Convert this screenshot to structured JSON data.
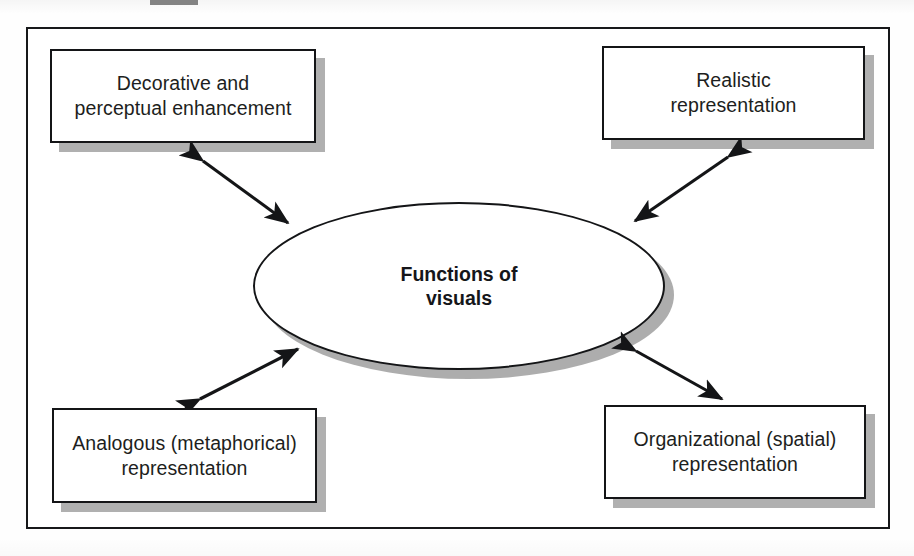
{
  "figure": {
    "kind": "concept-map",
    "center": {
      "shape": "ellipse",
      "label": "Functions of\nvisuals"
    },
    "nodes": [
      {
        "id": "decorative",
        "position": "top-left",
        "label": "Decorative and\nperceptual enhancement"
      },
      {
        "id": "realistic",
        "position": "top-right",
        "label": "Realistic\nrepresentation"
      },
      {
        "id": "analogous",
        "position": "bottom-left",
        "label": "Analogous (metaphorical)\nrepresentation"
      },
      {
        "id": "organizational",
        "position": "bottom-right",
        "label": "Organizational (spatial)\nrepresentation"
      }
    ],
    "connectors": [
      {
        "id": "center-decorative",
        "from": "center",
        "to": "decorative",
        "style": "double-headed-arrow"
      },
      {
        "id": "center-realistic",
        "from": "center",
        "to": "realistic",
        "style": "double-headed-arrow"
      },
      {
        "id": "center-analogous",
        "from": "center",
        "to": "analogous",
        "style": "double-headed-arrow"
      },
      {
        "id": "center-organizational",
        "from": "center",
        "to": "organizational",
        "style": "double-headed-arrow"
      }
    ],
    "colors": {
      "stroke": "#141517",
      "fill": "#ffffff",
      "shadow": "#a9a9a9",
      "text": "#1d1e20",
      "page": "#fefefe"
    }
  }
}
